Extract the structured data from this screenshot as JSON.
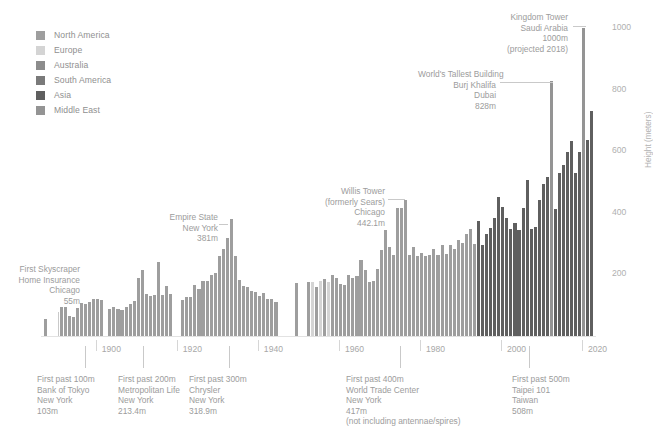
{
  "chart_data": {
    "type": "bar",
    "title": "",
    "xlabel": "",
    "ylabel": "Height (meters)",
    "ylim": [
      0,
      1050
    ],
    "xlim": [
      1884,
      2021
    ],
    "grid": false,
    "legend_position": "top-left",
    "yticks": [
      200,
      400,
      600,
      800,
      1000
    ],
    "ytick_labels": [
      "200",
      "400",
      "600",
      "800",
      "1000"
    ],
    "xticks": [
      1900,
      1920,
      1940,
      1960,
      1980,
      2000,
      2020
    ],
    "xtick_labels": [
      "1900",
      "1920",
      "1940",
      "1960",
      "1980",
      "2000",
      "2020"
    ],
    "legend": [
      {
        "label": "North America",
        "color": "#9e9e9e"
      },
      {
        "label": "Europe",
        "color": "#d4d4d4"
      },
      {
        "label": "Australia",
        "color": "#8c8c8c"
      },
      {
        "label": "South America",
        "color": "#7a7a7a"
      },
      {
        "label": "Asia",
        "color": "#5f5f5f"
      },
      {
        "label": "Middle East",
        "color": "#949494"
      }
    ],
    "series_name": "Tallest building completed each year",
    "points": [
      {
        "x": 1885,
        "y": 55,
        "region": "North America"
      },
      {
        "x": 1889,
        "y": 94,
        "region": "North America"
      },
      {
        "x": 1890,
        "y": 94,
        "region": "North America"
      },
      {
        "x": 1891,
        "y": 64,
        "region": "North America"
      },
      {
        "x": 1892,
        "y": 63,
        "region": "North America"
      },
      {
        "x": 1893,
        "y": 92,
        "region": "North America"
      },
      {
        "x": 1894,
        "y": 106,
        "region": "North America"
      },
      {
        "x": 1895,
        "y": 103,
        "region": "North America"
      },
      {
        "x": 1896,
        "y": 112,
        "region": "North America"
      },
      {
        "x": 1897,
        "y": 119,
        "region": "North America"
      },
      {
        "x": 1898,
        "y": 119,
        "region": "North America"
      },
      {
        "x": 1899,
        "y": 118,
        "region": "North America"
      },
      {
        "x": 1901,
        "y": 87,
        "region": "North America"
      },
      {
        "x": 1902,
        "y": 93,
        "region": "North America"
      },
      {
        "x": 1903,
        "y": 87,
        "region": "North America"
      },
      {
        "x": 1904,
        "y": 86,
        "region": "North America"
      },
      {
        "x": 1905,
        "y": 95,
        "region": "North America"
      },
      {
        "x": 1906,
        "y": 104,
        "region": "North America"
      },
      {
        "x": 1907,
        "y": 114,
        "region": "North America"
      },
      {
        "x": 1908,
        "y": 187,
        "region": "North America"
      },
      {
        "x": 1909,
        "y": 213,
        "region": "North America"
      },
      {
        "x": 1910,
        "y": 137,
        "region": "North America"
      },
      {
        "x": 1911,
        "y": 129,
        "region": "North America"
      },
      {
        "x": 1912,
        "y": 133,
        "region": "North America"
      },
      {
        "x": 1913,
        "y": 241,
        "region": "North America"
      },
      {
        "x": 1914,
        "y": 134,
        "region": "North America"
      },
      {
        "x": 1915,
        "y": 164,
        "region": "North America"
      },
      {
        "x": 1916,
        "y": 138,
        "region": "North America"
      },
      {
        "x": 1919,
        "y": 117,
        "region": "North America"
      },
      {
        "x": 1920,
        "y": 128,
        "region": "North America"
      },
      {
        "x": 1921,
        "y": 128,
        "region": "North America"
      },
      {
        "x": 1922,
        "y": 165,
        "region": "North America"
      },
      {
        "x": 1923,
        "y": 152,
        "region": "North America"
      },
      {
        "x": 1924,
        "y": 177,
        "region": "North America"
      },
      {
        "x": 1925,
        "y": 178,
        "region": "North America"
      },
      {
        "x": 1926,
        "y": 198,
        "region": "North America"
      },
      {
        "x": 1927,
        "y": 203,
        "region": "North America"
      },
      {
        "x": 1928,
        "y": 260,
        "region": "North America"
      },
      {
        "x": 1929,
        "y": 283,
        "region": "North America"
      },
      {
        "x": 1930,
        "y": 318.9,
        "region": "North America"
      },
      {
        "x": 1931,
        "y": 381,
        "region": "North America"
      },
      {
        "x": 1932,
        "y": 260,
        "region": "North America"
      },
      {
        "x": 1933,
        "y": 183,
        "region": "North America"
      },
      {
        "x": 1934,
        "y": 162,
        "region": "North America"
      },
      {
        "x": 1935,
        "y": 159,
        "region": "North America"
      },
      {
        "x": 1936,
        "y": 146,
        "region": "North America"
      },
      {
        "x": 1937,
        "y": 143,
        "region": "North America"
      },
      {
        "x": 1938,
        "y": 130,
        "region": "North America"
      },
      {
        "x": 1939,
        "y": 141,
        "region": "North America"
      },
      {
        "x": 1940,
        "y": 119,
        "region": "North America"
      },
      {
        "x": 1941,
        "y": 120,
        "region": "North America"
      },
      {
        "x": 1942,
        "y": 111,
        "region": "North America"
      },
      {
        "x": 1947,
        "y": 173,
        "region": "North America"
      },
      {
        "x": 1950,
        "y": 176,
        "region": "North America"
      },
      {
        "x": 1951,
        "y": 176,
        "region": "Europe"
      },
      {
        "x": 1952,
        "y": 158,
        "region": "North America"
      },
      {
        "x": 1953,
        "y": 180,
        "region": "Europe"
      },
      {
        "x": 1954,
        "y": 184,
        "region": "North America"
      },
      {
        "x": 1955,
        "y": 176,
        "region": "Europe"
      },
      {
        "x": 1956,
        "y": 197,
        "region": "North America"
      },
      {
        "x": 1957,
        "y": 189,
        "region": "North America"
      },
      {
        "x": 1958,
        "y": 168,
        "region": "North America"
      },
      {
        "x": 1959,
        "y": 165,
        "region": "North America"
      },
      {
        "x": 1960,
        "y": 198,
        "region": "North America"
      },
      {
        "x": 1961,
        "y": 187,
        "region": "North America"
      },
      {
        "x": 1962,
        "y": 195,
        "region": "North America"
      },
      {
        "x": 1963,
        "y": 248,
        "region": "North America"
      },
      {
        "x": 1964,
        "y": 215,
        "region": "North America"
      },
      {
        "x": 1965,
        "y": 174,
        "region": "North America"
      },
      {
        "x": 1966,
        "y": 180,
        "region": "North America"
      },
      {
        "x": 1967,
        "y": 219,
        "region": "North America"
      },
      {
        "x": 1968,
        "y": 280,
        "region": "North America"
      },
      {
        "x": 1969,
        "y": 344,
        "region": "North America"
      },
      {
        "x": 1970,
        "y": 290,
        "region": "North America"
      },
      {
        "x": 1971,
        "y": 262,
        "region": "North America"
      },
      {
        "x": 1972,
        "y": 417,
        "region": "North America"
      },
      {
        "x": 1973,
        "y": 415,
        "region": "North America"
      },
      {
        "x": 1974,
        "y": 442.1,
        "region": "North America"
      },
      {
        "x": 1975,
        "y": 262,
        "region": "North America"
      },
      {
        "x": 1976,
        "y": 288,
        "region": "North America"
      },
      {
        "x": 1977,
        "y": 260,
        "region": "North America"
      },
      {
        "x": 1978,
        "y": 271,
        "region": "North America"
      },
      {
        "x": 1979,
        "y": 259,
        "region": "North America"
      },
      {
        "x": 1980,
        "y": 262,
        "region": "North America"
      },
      {
        "x": 1981,
        "y": 281,
        "region": "North America"
      },
      {
        "x": 1982,
        "y": 262,
        "region": "North America"
      },
      {
        "x": 1983,
        "y": 295,
        "region": "North America"
      },
      {
        "x": 1984,
        "y": 265,
        "region": "North America"
      },
      {
        "x": 1985,
        "y": 295,
        "region": "North America"
      },
      {
        "x": 1986,
        "y": 281,
        "region": "North America"
      },
      {
        "x": 1987,
        "y": 312,
        "region": "North America"
      },
      {
        "x": 1988,
        "y": 302,
        "region": "North America"
      },
      {
        "x": 1989,
        "y": 330,
        "region": "North America"
      },
      {
        "x": 1990,
        "y": 346,
        "region": "North America"
      },
      {
        "x": 1991,
        "y": 300,
        "region": "North America"
      },
      {
        "x": 1992,
        "y": 374,
        "region": "Asia"
      },
      {
        "x": 1993,
        "y": 296,
        "region": "Asia"
      },
      {
        "x": 1994,
        "y": 330,
        "region": "Asia"
      },
      {
        "x": 1995,
        "y": 350,
        "region": "Asia"
      },
      {
        "x": 1996,
        "y": 384,
        "region": "Asia"
      },
      {
        "x": 1997,
        "y": 451.9,
        "region": "Asia"
      },
      {
        "x": 1998,
        "y": 420,
        "region": "Asia"
      },
      {
        "x": 1999,
        "y": 384,
        "region": "Asia"
      },
      {
        "x": 2000,
        "y": 348,
        "region": "Asia"
      },
      {
        "x": 2001,
        "y": 366,
        "region": "Asia"
      },
      {
        "x": 2002,
        "y": 345,
        "region": "Asia"
      },
      {
        "x": 2003,
        "y": 415,
        "region": "Asia"
      },
      {
        "x": 2004,
        "y": 508,
        "region": "Asia"
      },
      {
        "x": 2005,
        "y": 348,
        "region": "Asia"
      },
      {
        "x": 2006,
        "y": 355,
        "region": "Asia"
      },
      {
        "x": 2007,
        "y": 442,
        "region": "Asia"
      },
      {
        "x": 2008,
        "y": 492,
        "region": "Asia"
      },
      {
        "x": 2009,
        "y": 517,
        "region": "Asia"
      },
      {
        "x": 2010,
        "y": 828,
        "region": "Middle East"
      },
      {
        "x": 2011,
        "y": 413,
        "region": "Asia"
      },
      {
        "x": 2012,
        "y": 530,
        "region": "Asia"
      },
      {
        "x": 2013,
        "y": 555,
        "region": "Asia"
      },
      {
        "x": 2014,
        "y": 599,
        "region": "Asia"
      },
      {
        "x": 2015,
        "y": 632,
        "region": "Asia"
      },
      {
        "x": 2016,
        "y": 530,
        "region": "Asia"
      },
      {
        "x": 2017,
        "y": 599,
        "region": "Asia"
      },
      {
        "x": 2018,
        "y": 1000,
        "region": "Middle East"
      },
      {
        "x": 2019,
        "y": 636,
        "region": "Asia"
      },
      {
        "x": 2020,
        "y": 730,
        "region": "Asia"
      }
    ],
    "annotations": [
      {
        "id": "first-skyscraper",
        "lines": [
          "First Skyscraper",
          "Home Insurance",
          "Chicago",
          "55m"
        ],
        "align": "right",
        "x": 1885,
        "value": 55
      },
      {
        "id": "empire-state",
        "lines": [
          "Empire State",
          "New York",
          "381m"
        ],
        "align": "right",
        "x": 1931,
        "value": 381
      },
      {
        "id": "willis-tower",
        "lines": [
          "Willis Tower",
          "(formerly Sears)",
          "Chicago",
          "442.1m"
        ],
        "align": "right",
        "x": 1974,
        "value": 442.1
      },
      {
        "id": "burj-khalifa",
        "lines": [
          "World's Tallest Building",
          "Burj Khalifa",
          "Dubai",
          "828m"
        ],
        "align": "right",
        "x": 2010,
        "value": 828
      },
      {
        "id": "kingdom-tower",
        "lines": [
          "Kingdom Tower",
          "Saudi Arabia",
          "1000m",
          "(projected 2018)"
        ],
        "align": "right",
        "x": 2018,
        "value": 1000
      },
      {
        "id": "first-past-100m",
        "lines": [
          "First past 100m",
          "Bank of Tokyo",
          "New York",
          "103m"
        ],
        "align": "left",
        "x": 1895,
        "value": 103
      },
      {
        "id": "first-past-200m",
        "lines": [
          "First past 200m",
          "Metropolitan Life",
          "New York",
          "213.4m"
        ],
        "align": "left",
        "x": 1909,
        "value": 213.4
      },
      {
        "id": "first-past-300m",
        "lines": [
          "First past 300m",
          "Chrysler",
          "New York",
          "318.9m"
        ],
        "align": "left",
        "x": 1930,
        "value": 318.9
      },
      {
        "id": "first-past-400m",
        "lines": [
          "First past 400m",
          "World Trade Center",
          "New York",
          "417m",
          "(not including antennae/spires)"
        ],
        "align": "left",
        "x": 1972,
        "value": 417
      },
      {
        "id": "first-past-500m",
        "lines": [
          "First past 500m",
          "Taipei 101",
          "Taiwan",
          "508m"
        ],
        "align": "left",
        "x": 2004,
        "value": 508
      }
    ]
  }
}
